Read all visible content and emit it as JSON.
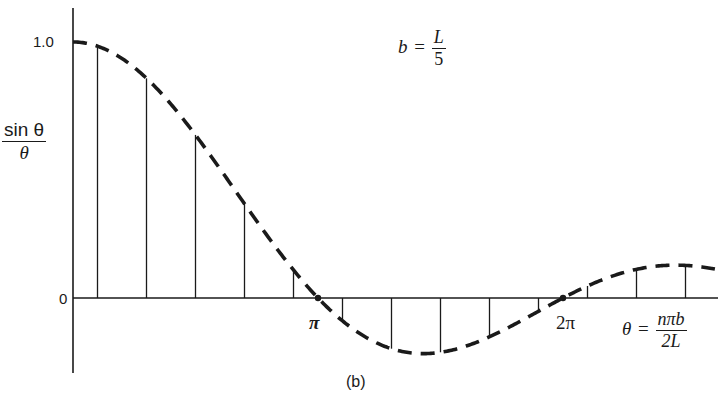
{
  "chart_data": {
    "type": "line",
    "subtype": "sinc envelope with sampled stems",
    "title": "",
    "caption": "(b)",
    "annotation": {
      "lhs": "b",
      "eq": "=",
      "num": "L",
      "den": "5"
    },
    "ylabel": {
      "num": "sin θ",
      "den": "θ"
    },
    "xlabel": {
      "lhs": "θ",
      "eq": "=",
      "num": "nπb",
      "den": "2L"
    },
    "y_ticks": [
      {
        "value": 1.0,
        "label": "1.0"
      },
      {
        "value": 0,
        "label": "0"
      }
    ],
    "x_ticks": [
      {
        "value_pi": 1,
        "label": "π"
      },
      {
        "value_pi": 2,
        "label": "2π"
      }
    ],
    "xlim_pi": [
      0,
      2.62
    ],
    "ylim": [
      -0.3,
      1.12
    ],
    "grid": false,
    "legend": null,
    "envelope": {
      "function": "sin(θ)/θ",
      "style": "dashed"
    },
    "stems": {
      "theta_over_pi": [
        0.1,
        0.3,
        0.5,
        0.7,
        0.9,
        1.1,
        1.3,
        1.5,
        1.7,
        1.9,
        2.1,
        2.3,
        2.5
      ],
      "n": [
        1,
        3,
        5,
        7,
        9,
        11,
        13,
        15,
        17,
        19,
        21,
        23,
        25
      ],
      "values": [
        0.984,
        0.858,
        0.637,
        0.368,
        0.109,
        -0.089,
        -0.198,
        -0.212,
        -0.151,
        -0.052,
        0.047,
        0.112,
        0.127
      ]
    },
    "zero_crossings_pi": [
      1,
      2
    ]
  },
  "colors": {
    "ink": "#1a1a1a",
    "background": "#ffffff"
  },
  "layout": {
    "origin_x": 73,
    "origin_y": 298,
    "px_per_pi": 245,
    "px_per_unit_y": 256,
    "y_axis_top": 8,
    "y_axis_bottom": 373,
    "x_axis_right": 718
  }
}
